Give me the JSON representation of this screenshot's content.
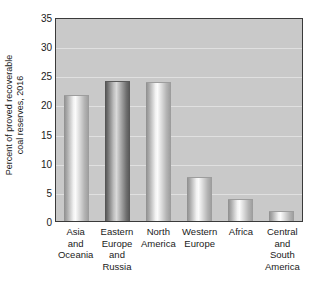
{
  "chart_data": {
    "type": "bar",
    "title": "",
    "xlabel": "",
    "ylabel": "Percent of proved recoverable coal reserves, 2016",
    "ylabel_line1": "Percent of proved recoverable",
    "ylabel_line2": "coal reserves, 2016",
    "categories": [
      "Asia\nand\nOceania",
      "Eastern\nEurope\nand\nRussia",
      "North\nAmerica",
      "Western\nEurope",
      "Africa",
      "Central\nand\nSouth\nAmerica"
    ],
    "values": [
      21.5,
      23.8,
      23.6,
      7.4,
      3.6,
      1.6
    ],
    "ylim": [
      0,
      35
    ],
    "yticks": [
      0,
      5,
      10,
      15,
      20,
      25,
      30,
      35
    ],
    "ytick_labels": [
      "0",
      "5",
      "10",
      "15",
      "20",
      "25",
      "30",
      "35"
    ],
    "grid": true,
    "legend": "none",
    "plot_background": "#c9c9c9",
    "bar_styles": [
      "light",
      "dark",
      "light",
      "light",
      "light",
      "light"
    ]
  }
}
